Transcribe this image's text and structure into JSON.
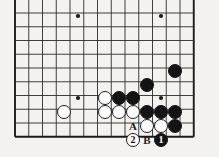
{
  "diagram": {
    "kind": "go-board-problem-diagram",
    "board": {
      "background_color": "#f4f2ef",
      "line_color": "#2b2b2b",
      "edge_line_color": "#1a1a1a",
      "origin_x": 15,
      "origin_y": 13,
      "spacing": 13.75,
      "cols": 14,
      "rows": 10,
      "edges": {
        "left": true,
        "top": false,
        "right": true,
        "bottom": true
      },
      "star_points": [
        {
          "x": 78,
          "y": 16
        },
        {
          "x": 161,
          "y": 16
        },
        {
          "x": 78,
          "y": 98
        },
        {
          "x": 161,
          "y": 98
        }
      ]
    },
    "stones": [
      {
        "id": "b1",
        "color": "black",
        "x": 175,
        "y": 71,
        "label": ""
      },
      {
        "id": "b2",
        "color": "black",
        "x": 147,
        "y": 85,
        "label": ""
      },
      {
        "id": "b3",
        "color": "black",
        "x": 119,
        "y": 98,
        "label": ""
      },
      {
        "id": "b4",
        "color": "black",
        "x": 133,
        "y": 98,
        "label": ""
      },
      {
        "id": "b5",
        "color": "black",
        "x": 147,
        "y": 112,
        "label": ""
      },
      {
        "id": "b6",
        "color": "black",
        "x": 161,
        "y": 112,
        "label": ""
      },
      {
        "id": "b7",
        "color": "black",
        "x": 175,
        "y": 112,
        "label": ""
      },
      {
        "id": "b8",
        "color": "black",
        "x": 175,
        "y": 126,
        "label": ""
      },
      {
        "id": "b9",
        "color": "black",
        "x": 161,
        "y": 140,
        "label": "1"
      },
      {
        "id": "w1",
        "color": "white",
        "x": 64,
        "y": 112,
        "label": ""
      },
      {
        "id": "w2",
        "color": "white",
        "x": 105,
        "y": 98,
        "label": ""
      },
      {
        "id": "w3",
        "color": "white",
        "x": 105,
        "y": 112,
        "label": ""
      },
      {
        "id": "w4",
        "color": "white",
        "x": 119,
        "y": 112,
        "label": ""
      },
      {
        "id": "w5",
        "color": "white",
        "x": 133,
        "y": 112,
        "label": ""
      },
      {
        "id": "w6",
        "color": "white",
        "x": 147,
        "y": 126,
        "label": ""
      },
      {
        "id": "w7",
        "color": "white",
        "x": 161,
        "y": 126,
        "label": ""
      },
      {
        "id": "w8",
        "color": "white",
        "x": 133,
        "y": 140,
        "label": "2"
      }
    ],
    "point_labels": [
      {
        "id": "a",
        "text": "A",
        "x": 133,
        "y": 126
      },
      {
        "id": "b",
        "text": "B",
        "x": 147,
        "y": 140
      }
    ]
  }
}
